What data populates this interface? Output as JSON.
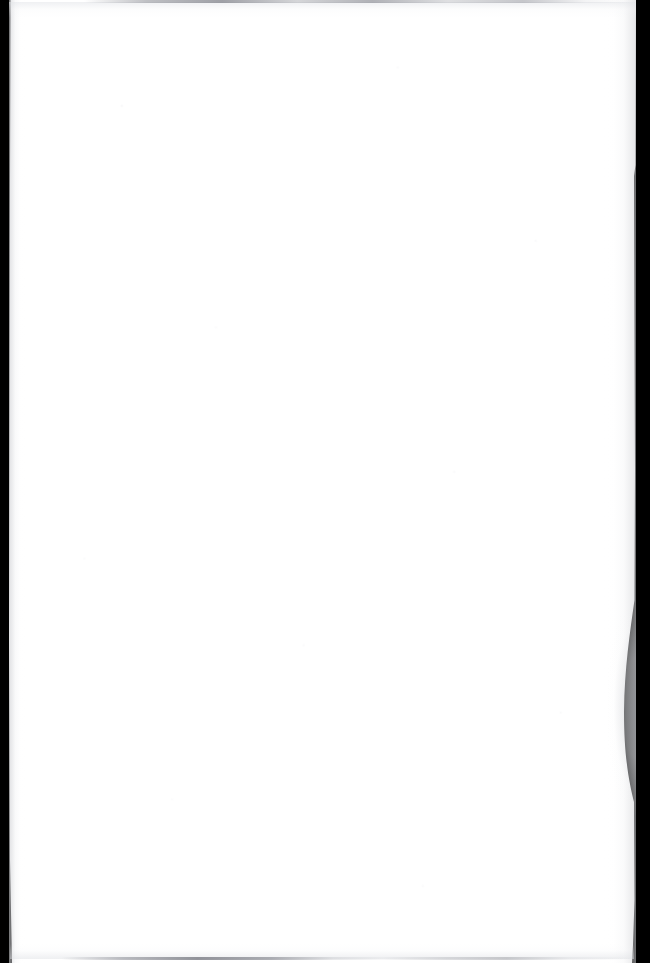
{
  "document": {
    "kind": "scanned-page",
    "page_content": "",
    "page_text": "",
    "is_blank": true,
    "visible_text_count": 0
  },
  "canvas": {
    "width": 650,
    "height": 963
  },
  "colors": {
    "scanner_background": "#000000",
    "paper_white": "#ffffff",
    "paper_shadow": "#d0d1d5",
    "edge_line_gray": "#7a7c84"
  },
  "paper": {
    "left_edge_x": 9,
    "right_edge_x": 635,
    "top_edge_y": 0,
    "bottom_edge_y": 963,
    "curl": {
      "present": true,
      "side": "right",
      "start_y": 600,
      "peak_y": 712,
      "end_y": 800,
      "peak_inset_x": 624
    }
  },
  "marks": {
    "top_edge_line": {
      "y": 1,
      "description": "faint gray scan line across the top of the sheet"
    },
    "bottom_edge_line": {
      "y": 958,
      "description": "faint gray scan line across the lower part of the sheet"
    }
  },
  "borders": {
    "left_band_width": 9,
    "right_band_width": 15,
    "description": "black scanner bed visible beyond the paper edges"
  }
}
